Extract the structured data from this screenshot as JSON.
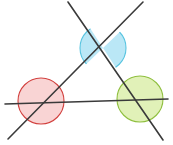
{
  "figure": {
    "canvas": {
      "width": 173,
      "height": 145,
      "background": "#ffffff"
    },
    "line_color": "#3a3a3a",
    "line_width": 1.6,
    "lines": [
      {
        "id": "horizontal-line",
        "label": "Horizontal transversal",
        "x1": 5,
        "y1": 104,
        "x2": 168,
        "y2": 99,
        "color": "#3a3a3a"
      },
      {
        "id": "diagonal-line-right",
        "label": "Diagonal descending to the right",
        "x1": 68,
        "y1": 2,
        "x2": 163,
        "y2": 140,
        "color": "#3a3a3a"
      },
      {
        "id": "diagonal-line-left",
        "label": "Diagonal descending to the left",
        "x1": 143,
        "y1": 2,
        "x2": 8,
        "y2": 139,
        "color": "#3a3a3a"
      }
    ],
    "intersections": [
      {
        "id": "top-vertex",
        "label": "Crossing of the two diagonals",
        "x": 103,
        "y": 48
      },
      {
        "id": "left-vertex",
        "label": "Crossing of left diagonal and horizontal",
        "x": 41,
        "y": 101
      },
      {
        "id": "right-vertex",
        "label": "Crossing of right diagonal and horizontal",
        "x": 140,
        "y": 99
      }
    ],
    "angle_regions": [
      {
        "id": "blue-angle",
        "label": "Blue vertical angle pair at top vertex",
        "color_name": "blue",
        "fill": "#aee3f5",
        "stroke": "#58c4e0",
        "opacity": 0.85,
        "cx": 103,
        "cy": 48,
        "r": 23,
        "shape": "vertical-angle-wedges"
      },
      {
        "id": "red-angle",
        "label": "Red angle circle at left vertex",
        "color_name": "red",
        "fill": "#f8cdcd",
        "stroke": "#d2413f",
        "opacity": 0.85,
        "cx": 41,
        "cy": 101,
        "r": 23,
        "shape": "full-circle"
      },
      {
        "id": "green-angle",
        "label": "Green angle circle at right vertex",
        "color_name": "green",
        "fill": "#dcefab",
        "stroke": "#8fbf3f",
        "opacity": 0.85,
        "cx": 140,
        "cy": 99,
        "r": 23,
        "shape": "full-circle"
      }
    ]
  }
}
